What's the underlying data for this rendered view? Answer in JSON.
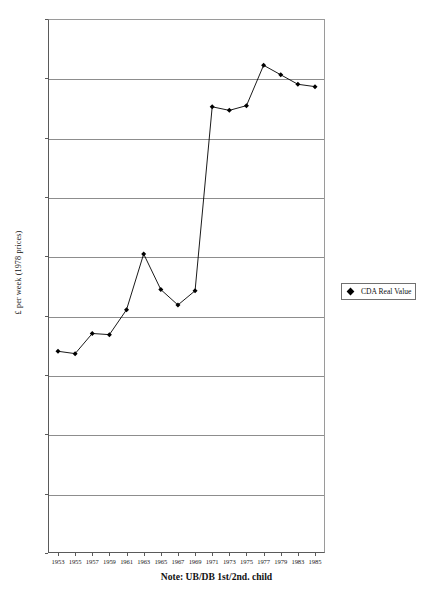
{
  "chart_data": {
    "type": "line",
    "title": "",
    "subtitle": "",
    "xlabel": "",
    "ylabel": "£ per week (1978 prices)",
    "note": "Note: UB/DB 1st/2nd. child",
    "grid": true,
    "legend_position": "right",
    "xlim": [
      1952,
      1986
    ],
    "ylim": [
      0,
      4.5
    ],
    "ytick_values": [
      0,
      0.5,
      1,
      1.5,
      2,
      2.5,
      3,
      3.5,
      4,
      4.5
    ],
    "ytick_labels": [
      "0",
      "0.5",
      "1",
      "1.5",
      "2",
      "2.5",
      "3",
      "3.5",
      "4",
      "4.5"
    ],
    "categories": [
      "1953",
      "1955",
      "1957",
      "1959",
      "1961",
      "1963",
      "1965",
      "1967",
      "1969",
      "1971",
      "1973",
      "1975",
      "1977",
      "1979",
      "1983",
      "1985"
    ],
    "xtick_labels": [
      "1953",
      "1955",
      "1957",
      "1959",
      "1961",
      "1963",
      "1965",
      "1967",
      "1969",
      "1971",
      "1973",
      "1975",
      "1977",
      "1979",
      "1983",
      "1985"
    ],
    "series": [
      {
        "name": "CDA Real Value",
        "marker": "diamond",
        "color": "#000000",
        "values": [
          1.7,
          1.68,
          1.85,
          1.84,
          2.05,
          2.52,
          2.22,
          2.09,
          2.21,
          3.76,
          3.73,
          3.77,
          4.11,
          4.03,
          3.95,
          3.93
        ]
      }
    ]
  },
  "legend": {
    "entries": [
      {
        "label": "CDA Real Value",
        "marker": "diamond-marker",
        "color": "#000000"
      }
    ]
  },
  "axes": {
    "y_title": "£ per week (1978 prices)"
  },
  "note": {
    "text": "Note: UB/DB 1st/2nd. child"
  }
}
